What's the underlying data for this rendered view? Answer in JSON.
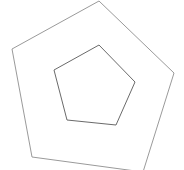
{
  "figure": {
    "background_color": "#ffffff",
    "width": 184,
    "height": 170
  },
  "chart_data": {
    "type": "scatter",
    "xlabel": "",
    "ylabel": "",
    "grid": false,
    "legend": null,
    "xlim": [
      0,
      184
    ],
    "ylim": [
      0,
      170
    ],
    "shapes": [
      {
        "name": "outer-pentagon",
        "sides": 5,
        "stroke": "#9a9a9a",
        "stroke_width": 1,
        "fill": "none",
        "closed": true,
        "center": [
          100,
          79
        ],
        "circumradius": 81,
        "rotation_deg": -1,
        "points": [
          [
            99,
            1
          ],
          [
            174,
            73
          ],
          [
            143,
            172
          ],
          [
            32,
            157
          ],
          [
            12,
            49
          ]
        ]
      },
      {
        "name": "inner-pentagon",
        "sides": 5,
        "stroke": "#6a6a6a",
        "stroke_width": 1,
        "fill": "none",
        "closed": true,
        "center": [
          94,
          88
        ],
        "circumradius": 43,
        "rotation_deg": -2,
        "points": [
          [
            99,
            45
          ],
          [
            135,
            82
          ],
          [
            116,
            125
          ],
          [
            67,
            120
          ],
          [
            54,
            70
          ]
        ]
      }
    ]
  }
}
